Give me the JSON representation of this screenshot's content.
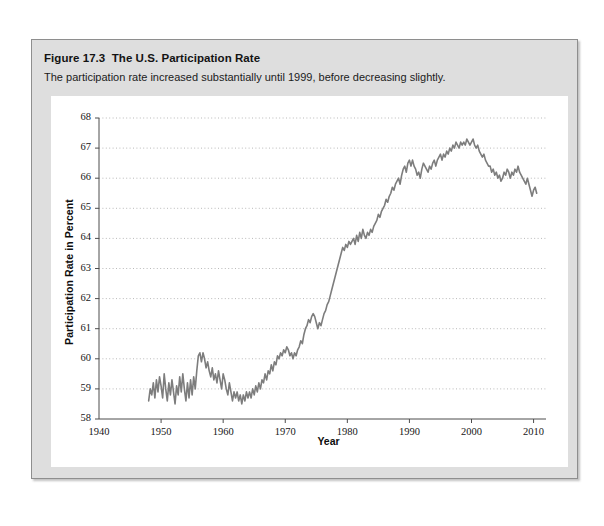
{
  "figure": {
    "number": "Figure 17.3",
    "title": "The U.S. Participation Rate",
    "subtitle": "The participation rate increased substantially until 1999, before decreasing slightly."
  },
  "colors": {
    "line": "#7d7d7d",
    "grid": "#b9b9b9",
    "axis": "#4d4d4d",
    "panel": "#dedede",
    "card": "#ffffff",
    "text": "#131313"
  },
  "chart_data": {
    "type": "line",
    "title": "The U.S. Participation Rate",
    "xlabel": "Year",
    "ylabel": "Participation Rate in Percent",
    "xlim": [
      1940,
      2012
    ],
    "ylim": [
      58,
      68
    ],
    "xticks": [
      1940,
      1950,
      1960,
      1970,
      1980,
      1990,
      2000,
      2010
    ],
    "yticks": [
      58,
      59,
      60,
      61,
      62,
      63,
      64,
      65,
      66,
      67,
      68
    ],
    "grid": true,
    "legend": "none",
    "series": [
      {
        "name": "U.S. Labor Force Participation Rate",
        "x": [
          1948.0,
          1948.25,
          1948.5,
          1948.75,
          1949.0,
          1949.25,
          1949.5,
          1949.75,
          1950.0,
          1950.25,
          1950.5,
          1950.75,
          1951.0,
          1951.25,
          1951.5,
          1951.75,
          1952.0,
          1952.25,
          1952.5,
          1952.75,
          1953.0,
          1953.25,
          1953.5,
          1953.75,
          1954.0,
          1954.25,
          1954.5,
          1954.75,
          1955.0,
          1955.25,
          1955.5,
          1955.75,
          1956.0,
          1956.25,
          1956.5,
          1956.75,
          1957.0,
          1957.25,
          1957.5,
          1957.75,
          1958.0,
          1958.25,
          1958.5,
          1958.75,
          1959.0,
          1959.25,
          1959.5,
          1959.75,
          1960.0,
          1960.25,
          1960.5,
          1960.75,
          1961.0,
          1961.25,
          1961.5,
          1961.75,
          1962.0,
          1962.25,
          1962.5,
          1962.75,
          1963.0,
          1963.25,
          1963.5,
          1963.75,
          1964.0,
          1964.25,
          1964.5,
          1964.75,
          1965.0,
          1965.25,
          1965.5,
          1965.75,
          1966.0,
          1966.25,
          1966.5,
          1966.75,
          1967.0,
          1967.25,
          1967.5,
          1967.75,
          1968.0,
          1968.25,
          1968.5,
          1968.75,
          1969.0,
          1969.25,
          1969.5,
          1969.75,
          1970.0,
          1970.25,
          1970.5,
          1970.75,
          1971.0,
          1971.25,
          1971.5,
          1971.75,
          1972.0,
          1972.25,
          1972.5,
          1972.75,
          1973.0,
          1973.25,
          1973.5,
          1973.75,
          1974.0,
          1974.25,
          1974.5,
          1974.75,
          1975.0,
          1975.25,
          1975.5,
          1975.75,
          1976.0,
          1976.25,
          1976.5,
          1976.75,
          1977.0,
          1977.25,
          1977.5,
          1977.75,
          1978.0,
          1978.25,
          1978.5,
          1978.75,
          1979.0,
          1979.25,
          1979.5,
          1979.75,
          1980.0,
          1980.25,
          1980.5,
          1980.75,
          1981.0,
          1981.25,
          1981.5,
          1981.75,
          1982.0,
          1982.25,
          1982.5,
          1982.75,
          1983.0,
          1983.25,
          1983.5,
          1983.75,
          1984.0,
          1984.25,
          1984.5,
          1984.75,
          1985.0,
          1985.25,
          1985.5,
          1985.75,
          1986.0,
          1986.25,
          1986.5,
          1986.75,
          1987.0,
          1987.25,
          1987.5,
          1987.75,
          1988.0,
          1988.25,
          1988.5,
          1988.75,
          1989.0,
          1989.25,
          1989.5,
          1989.75,
          1990.0,
          1990.25,
          1990.5,
          1990.75,
          1991.0,
          1991.25,
          1991.5,
          1991.75,
          1992.0,
          1992.25,
          1992.5,
          1992.75,
          1993.0,
          1993.25,
          1993.5,
          1993.75,
          1994.0,
          1994.25,
          1994.5,
          1994.75,
          1995.0,
          1995.25,
          1995.5,
          1995.75,
          1996.0,
          1996.25,
          1996.5,
          1996.75,
          1997.0,
          1997.25,
          1997.5,
          1997.75,
          1998.0,
          1998.25,
          1998.5,
          1998.75,
          1999.0,
          1999.25,
          1999.5,
          1999.75,
          2000.0,
          2000.25,
          2000.5,
          2000.75,
          2001.0,
          2001.25,
          2001.5,
          2001.75,
          2002.0,
          2002.25,
          2002.5,
          2002.75,
          2003.0,
          2003.25,
          2003.5,
          2003.75,
          2004.0,
          2004.25,
          2004.5,
          2004.75,
          2005.0,
          2005.25,
          2005.5,
          2005.75,
          2006.0,
          2006.25,
          2006.5,
          2006.75,
          2007.0,
          2007.25,
          2007.5,
          2007.75,
          2008.0,
          2008.25,
          2008.5,
          2008.75,
          2009.0,
          2009.25,
          2009.5,
          2009.75,
          2010.0,
          2010.25,
          2010.5
        ],
        "y": [
          58.6,
          59.0,
          58.8,
          59.2,
          58.7,
          59.3,
          58.9,
          59.4,
          59.1,
          58.7,
          59.5,
          59.0,
          58.6,
          59.2,
          58.8,
          59.3,
          58.9,
          58.5,
          59.1,
          58.8,
          59.4,
          58.9,
          59.5,
          59.0,
          58.6,
          59.2,
          58.7,
          59.3,
          58.8,
          59.4,
          59.0,
          59.6,
          60.1,
          60.2,
          59.9,
          60.2,
          60.0,
          59.7,
          59.9,
          59.6,
          59.4,
          59.7,
          59.3,
          59.5,
          59.2,
          59.6,
          59.3,
          59.0,
          59.5,
          59.3,
          59.0,
          58.8,
          59.2,
          58.9,
          58.6,
          58.9,
          58.7,
          58.9,
          58.6,
          58.8,
          58.5,
          58.8,
          58.6,
          58.9,
          58.7,
          58.9,
          58.7,
          59.0,
          58.8,
          59.1,
          58.9,
          59.2,
          59.0,
          59.3,
          59.2,
          59.5,
          59.3,
          59.6,
          59.5,
          59.8,
          59.6,
          59.9,
          59.8,
          60.1,
          60.0,
          60.2,
          60.1,
          60.3,
          60.2,
          60.4,
          60.3,
          60.1,
          60.2,
          60.0,
          60.2,
          60.1,
          60.3,
          60.4,
          60.6,
          60.5,
          60.8,
          61.0,
          61.1,
          61.3,
          61.2,
          61.4,
          61.5,
          61.4,
          61.2,
          61.0,
          61.2,
          61.1,
          61.3,
          61.5,
          61.6,
          61.8,
          61.9,
          62.1,
          62.3,
          62.5,
          62.7,
          62.9,
          63.1,
          63.3,
          63.5,
          63.7,
          63.6,
          63.8,
          63.7,
          63.9,
          63.8,
          63.9,
          64.0,
          63.8,
          64.1,
          63.9,
          64.2,
          64.0,
          64.3,
          64.1,
          64.0,
          64.2,
          64.1,
          64.3,
          64.2,
          64.4,
          64.5,
          64.6,
          64.8,
          64.7,
          64.9,
          65.0,
          65.1,
          65.3,
          65.2,
          65.4,
          65.5,
          65.7,
          65.6,
          65.8,
          65.9,
          66.0,
          65.8,
          66.1,
          66.3,
          66.4,
          66.2,
          66.5,
          66.6,
          66.4,
          66.6,
          66.4,
          66.3,
          66.1,
          66.2,
          66.0,
          66.3,
          66.5,
          66.4,
          66.3,
          66.2,
          66.4,
          66.3,
          66.5,
          66.6,
          66.4,
          66.6,
          66.7,
          66.8,
          66.6,
          66.8,
          66.7,
          66.9,
          66.8,
          67.0,
          66.9,
          67.1,
          67.0,
          67.2,
          67.1,
          67.0,
          67.2,
          67.1,
          67.2,
          67.1,
          67.3,
          67.2,
          67.1,
          67.2,
          67.3,
          67.1,
          67.0,
          67.1,
          66.9,
          66.8,
          66.7,
          66.8,
          66.6,
          66.5,
          66.4,
          66.4,
          66.2,
          66.3,
          66.1,
          66.2,
          66.0,
          66.1,
          65.9,
          66.0,
          66.2,
          66.1,
          66.3,
          66.2,
          66.0,
          66.2,
          66.1,
          66.3,
          66.2,
          66.4,
          66.2,
          66.1,
          66.0,
          65.9,
          65.8,
          66.0,
          65.8,
          65.6,
          65.4,
          65.6,
          65.7,
          65.5
        ]
      }
    ],
    "annotations": {
      "peak_year": 1999,
      "peak_value": 67.3,
      "start_year": 1948,
      "start_value": 58.6,
      "end_year": 2010,
      "end_value": 65.5,
      "trough_year": 1963,
      "trough_value": 58.5
    }
  }
}
